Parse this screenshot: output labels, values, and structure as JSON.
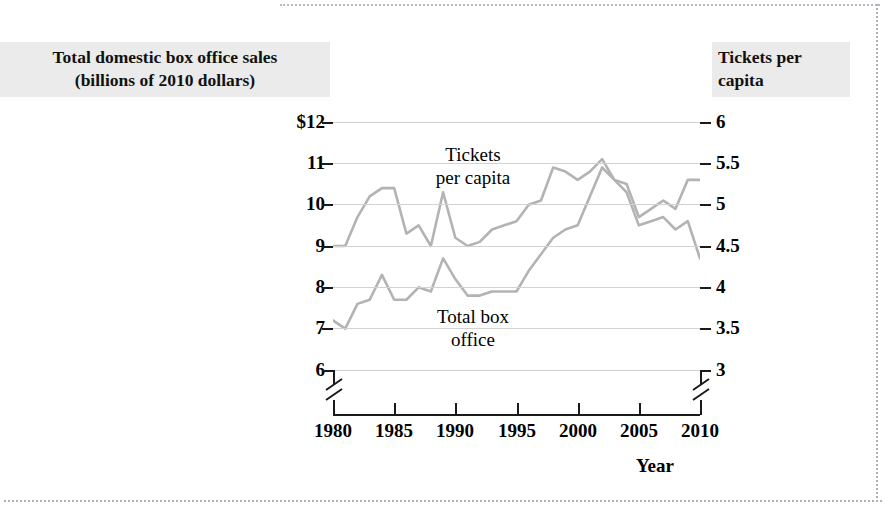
{
  "axis_titles": {
    "left": "Total domestic box office sales\n(billions of 2010 dollars)",
    "left_line1": "Total domestic box office sales",
    "left_line2": "(billions of 2010 dollars)",
    "right_line1": "Tickets per",
    "right_line2": "capita"
  },
  "series_labels": {
    "tickets_line1": "Tickets",
    "tickets_line2": "per capita",
    "boxoffice_line1": "Total box",
    "boxoffice_line2": "office"
  },
  "xlabel": "Year",
  "left_ticks": [
    "$12",
    "11",
    "10",
    "9",
    "8",
    "7",
    "6"
  ],
  "right_ticks": [
    "6",
    "5.5",
    "5",
    "4.5",
    "4",
    "3.5",
    "3"
  ],
  "x_ticks": [
    "1980",
    "1985",
    "1990",
    "1995",
    "2000",
    "2005",
    "2010"
  ],
  "colors": {
    "line": "#b3b3b3",
    "grid": "#d2d2d2",
    "axis": "#1a1a1a",
    "title_background": "#ebebeb",
    "page": "#ffffff"
  },
  "chart_data": {
    "type": "line",
    "title": "",
    "xlabel": "Year",
    "ylabel": "Total domestic box office sales (billions of 2010 dollars)",
    "y2label": "Tickets per capita",
    "xlim": [
      1980,
      2010
    ],
    "ylim": [
      6,
      12
    ],
    "y2lim": [
      3,
      6
    ],
    "grid": true,
    "legend": "inline-annotations",
    "axis_break": true,
    "x": [
      1980,
      1981,
      1982,
      1983,
      1984,
      1985,
      1986,
      1987,
      1988,
      1989,
      1990,
      1991,
      1992,
      1993,
      1994,
      1995,
      1996,
      1997,
      1998,
      1999,
      2000,
      2001,
      2002,
      2003,
      2004,
      2005,
      2006,
      2007,
      2008,
      2009,
      2010
    ],
    "series": [
      {
        "name": "Total box office",
        "axis": "left",
        "units": "billions of 2010 dollars",
        "values": [
          7.2,
          7.0,
          7.6,
          7.7,
          8.3,
          7.7,
          7.7,
          8.0,
          7.9,
          8.7,
          8.2,
          7.8,
          7.8,
          7.9,
          7.9,
          7.9,
          8.4,
          8.8,
          9.2,
          9.4,
          9.5,
          10.2,
          10.9,
          10.6,
          10.5,
          9.7,
          9.9,
          10.1,
          9.9,
          10.6,
          10.6
        ]
      },
      {
        "name": "Tickets per capita",
        "axis": "right",
        "units": "tickets per person per year",
        "values": [
          4.5,
          4.5,
          4.85,
          5.1,
          5.2,
          5.2,
          4.65,
          4.75,
          4.5,
          5.15,
          4.6,
          4.5,
          4.55,
          4.7,
          4.75,
          4.8,
          5.0,
          5.05,
          5.45,
          5.4,
          5.3,
          5.4,
          5.55,
          5.3,
          5.15,
          4.75,
          4.8,
          4.85,
          4.7,
          4.8,
          4.35
        ]
      }
    ]
  }
}
